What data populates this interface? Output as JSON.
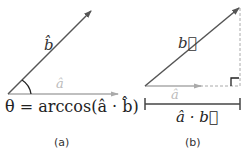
{
  "panels": [
    {
      "caption": "(a)",
      "vector_b_label": "b̂",
      "vector_a_label": "â",
      "formula": "θ = arccos(â · b̂)"
    },
    {
      "caption": "(b)",
      "vector_b_label": "b⃗",
      "vector_a_label": "â",
      "projection_label": "â · b⃗"
    }
  ],
  "colors": {
    "vector_b": "#555555",
    "vector_a": "#aaaaaa",
    "text_dark": "#333333",
    "text_light": "#bbbbbb",
    "dashed": "#aaaaaa",
    "bar": "#444444"
  }
}
